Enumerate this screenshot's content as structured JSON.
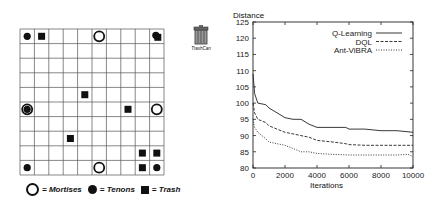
{
  "grid": {
    "rows": 10,
    "cols": 10,
    "mortises": [
      [
        0,
        5
      ],
      [
        5,
        0
      ],
      [
        5,
        9
      ],
      [
        9,
        5
      ]
    ],
    "tenons": [
      [
        0,
        0
      ],
      [
        0,
        9
      ],
      [
        5,
        0
      ],
      [
        9,
        0
      ],
      [
        9,
        9
      ]
    ],
    "trash": [
      [
        0,
        1
      ],
      [
        0,
        9
      ],
      [
        4,
        4
      ],
      [
        5,
        7
      ],
      [
        7,
        3
      ],
      [
        8,
        8
      ],
      [
        8,
        9
      ],
      [
        9,
        8
      ]
    ],
    "legend": {
      "mortises_label": "= Mortises",
      "tenons_label": "= Tenons",
      "trash_label": "= Trash"
    }
  },
  "trashcan": {
    "label": "TrashCan",
    "icon": "trash-can-icon"
  },
  "chart_data": {
    "type": "line",
    "title": "",
    "xlabel": "Iterations",
    "ylabel": "Distance",
    "xlim": [
      0,
      10000
    ],
    "ylim": [
      80,
      125
    ],
    "xticks": [
      0,
      2000,
      4000,
      6000,
      8000,
      10000
    ],
    "yticks": [
      80,
      85,
      90,
      95,
      100,
      105,
      110,
      115,
      120,
      125
    ],
    "grid": false,
    "legend_position": "top-right",
    "series": [
      {
        "name": "Q-Learning",
        "style": "solid",
        "x": [
          0,
          100,
          300,
          800,
          1000,
          1500,
          2000,
          2500,
          3000,
          3500,
          4000,
          5000,
          5800,
          6000,
          7000,
          8000,
          9000,
          10000
        ],
        "values": [
          109,
          103,
          100,
          99.5,
          98.5,
          97,
          95.5,
          95,
          95,
          93.5,
          92.5,
          92.5,
          92.5,
          92,
          92,
          91.5,
          91.5,
          91
        ]
      },
      {
        "name": "DQL",
        "style": "dashed",
        "x": [
          0,
          100,
          300,
          800,
          1000,
          1500,
          2000,
          2500,
          3000,
          3500,
          4000,
          5000,
          5800,
          6000,
          7000,
          8000,
          9000,
          10000
        ],
        "values": [
          100,
          97,
          95,
          94,
          93,
          92,
          91,
          90.5,
          90,
          89.5,
          88.5,
          88,
          87.5,
          87.2,
          87,
          87,
          87,
          87
        ]
      },
      {
        "name": "Ant-ViBRA",
        "style": "dotted",
        "x": [
          0,
          100,
          300,
          800,
          1000,
          1500,
          2000,
          2500,
          3000,
          3500,
          4000,
          5000,
          6000,
          7000,
          8000,
          9000,
          9700,
          10000
        ],
        "values": [
          95,
          92.5,
          91,
          89,
          88,
          87.5,
          87,
          86,
          85,
          85,
          84.5,
          84.2,
          84,
          84,
          84,
          84,
          84.2,
          83.5
        ]
      }
    ]
  }
}
